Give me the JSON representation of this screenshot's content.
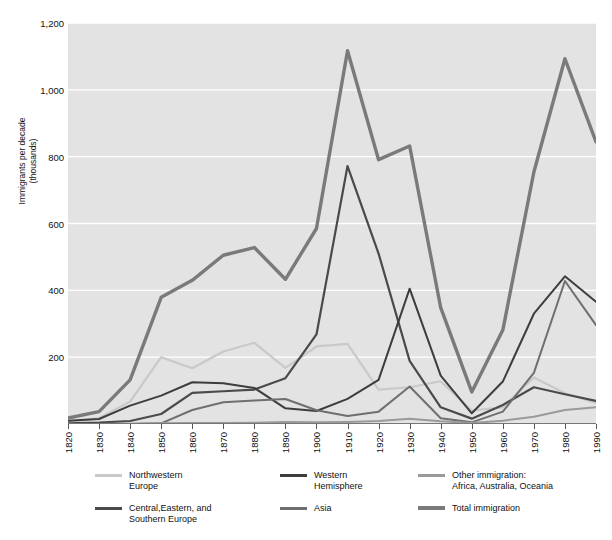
{
  "chart_data": {
    "type": "line",
    "title": "",
    "xlabel": "",
    "ylabel": "Immigrants per decade\n(thousands)",
    "ylim": [
      0,
      1200
    ],
    "yticks": [
      0,
      200,
      400,
      600,
      800,
      1000,
      1200
    ],
    "ytick_labels": [
      "0",
      "200",
      "400",
      "600",
      "800",
      "1,000",
      "1,200"
    ],
    "grid": "horizontal-white",
    "legend_position": "below",
    "plot_background": "#e3e3e3",
    "categories": [
      "1820",
      "1830",
      "1840",
      "1850",
      "1860",
      "1870",
      "1880",
      "1890",
      "1900",
      "1910",
      "1920",
      "1930",
      "1940",
      "1950",
      "1960",
      "1970",
      "1980",
      "1990"
    ],
    "x": [
      1820,
      1830,
      1840,
      1850,
      1860,
      1870,
      1880,
      1890,
      1900,
      1910,
      1920,
      1930,
      1940,
      1950,
      1960,
      1970,
      1980,
      1990
    ],
    "series": [
      {
        "name": "Northwestern Europe",
        "color": "#c9c9c9",
        "width": 2.2,
        "values": [
          6,
          18,
          67,
          200,
          167,
          217,
          243,
          168,
          232,
          240,
          103,
          110,
          128,
          40,
          50,
          139,
          92,
          63
        ]
      },
      {
        "name": "Central,Eastern, and Southern Europe",
        "color": "#4a4a4a",
        "width": 2.2,
        "values": [
          2,
          4,
          9,
          30,
          93,
          98,
          103,
          137,
          268,
          772,
          510,
          189,
          50,
          16,
          57,
          110,
          89,
          69
        ]
      },
      {
        "name": "Western Hemisphere",
        "color": "#3d3d3d",
        "width": 2.0,
        "values": [
          10,
          15,
          55,
          85,
          125,
          122,
          108,
          47,
          39,
          75,
          132,
          405,
          145,
          32,
          127,
          330,
          442,
          366
        ]
      },
      {
        "name": "Asia",
        "color": "#6f6f6f",
        "width": 2.0,
        "values": [
          0,
          0,
          0,
          2,
          42,
          65,
          70,
          75,
          41,
          24,
          37,
          112,
          17,
          5,
          37,
          153,
          428,
          296
        ]
      },
      {
        "name": "Other immigration: Africa, Australia, Oceania",
        "color": "#9a9a9a",
        "width": 2.0,
        "values": [
          0,
          0,
          1,
          2,
          3,
          3,
          4,
          6,
          5,
          6,
          9,
          16,
          8,
          3,
          10,
          22,
          42,
          50
        ]
      },
      {
        "name": "Total immigration",
        "color": "#7a7a7a",
        "width": 3.4,
        "values": [
          18,
          37,
          132,
          379,
          430,
          505,
          528,
          433,
          585,
          1117,
          791,
          832,
          348,
          96,
          281,
          754,
          1093,
          844
        ]
      }
    ],
    "notes": {
      "peak_decade": "1900-1910",
      "peak_total": 1117,
      "peak_central_eastern_southern_europe": 772
    }
  },
  "legend": {
    "items": [
      {
        "label": "Northwestern\nEurope",
        "color": "#c9c9c9",
        "thick": false
      },
      {
        "label": "Western\nHemisphere",
        "color": "#3d3d3d",
        "thick": false
      },
      {
        "label": "Other immigration:\nAfrica, Australia, Oceania",
        "color": "#9a9a9a",
        "thick": false
      },
      {
        "label": "Central,Eastern, and\nSouthern Europe",
        "color": "#4a4a4a",
        "thick": false
      },
      {
        "label": "Asia",
        "color": "#6f6f6f",
        "thick": false
      },
      {
        "label": "Total immigration",
        "color": "#7a7a7a",
        "thick": true
      }
    ]
  }
}
